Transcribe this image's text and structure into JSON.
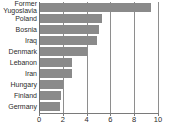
{
  "chart_data": {
    "type": "bar",
    "orientation": "horizontal",
    "title": "",
    "subtitle": "",
    "xlabel": "",
    "ylabel": "",
    "categories": [
      "Former\nYugoslavia",
      "Poland",
      "Bosnia",
      "Iraq",
      "Denmark",
      "Lebanon",
      "Iran",
      "Hungary",
      "Finland",
      "Germany"
    ],
    "values": [
      9.4,
      5.3,
      5.0,
      4.9,
      4.0,
      2.8,
      2.75,
      2.0,
      1.85,
      1.75
    ],
    "xlim": [
      0,
      10
    ],
    "xticks": [
      0,
      2,
      4,
      6,
      8,
      10
    ],
    "xtick_labels": [
      "0",
      "2",
      "4",
      "6",
      "8",
      "10"
    ],
    "grid": true,
    "grid_axis": "x",
    "legend": false,
    "bar_color": "#8a8a8a",
    "grid_color": "#8e8e8e",
    "axis_color": "#6d6d6d",
    "background": "#ffffff",
    "text_color": "#2b2b2b"
  }
}
